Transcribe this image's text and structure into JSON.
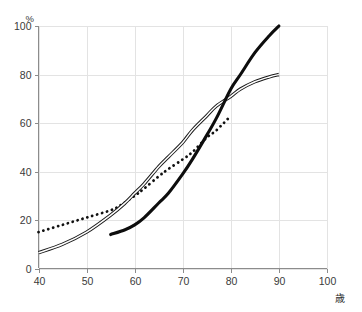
{
  "chart_data": {
    "type": "line",
    "title": "",
    "subtitle": "",
    "xlabel": "歳",
    "ylabel": "%",
    "xlim": [
      40,
      100
    ],
    "ylim": [
      0,
      100
    ],
    "xticks": [
      40,
      50,
      60,
      70,
      80,
      90,
      100
    ],
    "yticks": [
      0,
      20,
      40,
      60,
      80,
      100
    ],
    "xtick_labels": [
      "40",
      "50",
      "60",
      "70",
      "80",
      "90",
      "100"
    ],
    "ytick_labels": [
      "0",
      "20",
      "40",
      "60",
      "80",
      "100"
    ],
    "grid": true,
    "legend": "none",
    "annotations": [],
    "series": [
      {
        "name": "dotted-series",
        "style": "dotted",
        "color": "#111111",
        "x": [
          40,
          45,
          50,
          55,
          57,
          60,
          62,
          65,
          67,
          70,
          72,
          75,
          77,
          80
        ],
        "values": [
          15,
          18,
          21,
          24,
          26,
          30,
          33,
          38,
          41,
          45,
          48,
          54,
          57,
          63
        ]
      },
      {
        "name": "outlined-series",
        "style": "double-line",
        "color": "#1a1a1a",
        "x": [
          40,
          45,
          50,
          55,
          58,
          60,
          62,
          65,
          67,
          70,
          72,
          75,
          77,
          80,
          82,
          85,
          88,
          90
        ],
        "values": [
          6.5,
          10,
          15,
          22,
          27,
          31,
          35,
          42,
          46,
          52,
          57,
          63,
          67,
          71,
          74,
          77,
          79,
          80
        ]
      },
      {
        "name": "thick-series",
        "style": "solid-thick",
        "color": "#0d0d0d",
        "x": [
          55,
          58,
          60,
          62,
          65,
          67,
          70,
          72,
          75,
          77,
          80,
          82,
          85,
          88,
          90
        ],
        "values": [
          14,
          16,
          18,
          21,
          27,
          31,
          39,
          45,
          55,
          62,
          74,
          80,
          89,
          96,
          100
        ]
      }
    ]
  },
  "axes": {
    "y_unit_label": "%",
    "x_unit_label": "歳"
  }
}
